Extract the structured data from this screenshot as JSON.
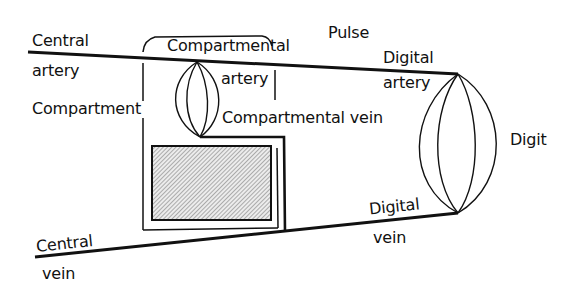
{
  "diagram": {
    "labels": {
      "central_artery_1": "Central",
      "central_artery_2": "artery",
      "compartmental_artery_1": "Compartmental",
      "compartmental_artery_2": "artery",
      "pulse": "Pulse",
      "digital_artery_1": "Digital",
      "digital_artery_2": "artery",
      "compartment": "Compartment",
      "compartmental_vein": "Compartmental vein",
      "digit": "Digit",
      "digital_vein_1": "Digital",
      "digital_vein_2": "vein",
      "central_vein_1": "Central",
      "central_vein_2": "vein"
    },
    "colors": {
      "line": "#111111",
      "hatch": "#555555",
      "background": "#ffffff"
    }
  }
}
